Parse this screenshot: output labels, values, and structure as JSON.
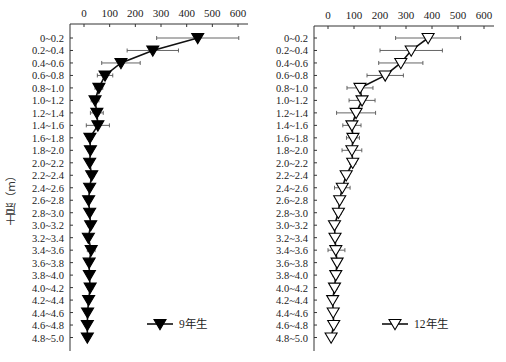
{
  "chart_data": [
    {
      "type": "line",
      "orientation": "horizontal-profile",
      "title": "",
      "xlabel": "",
      "ylabel": "土层（m）",
      "xlim": [
        0,
        600
      ],
      "xticks": [
        0,
        100,
        200,
        300,
        400,
        500,
        600
      ],
      "x_axis_position": "top",
      "grid": false,
      "legend_position": "lower right",
      "categories": [
        "0~0.2",
        "0.2~0.4",
        "0.4~0.6",
        "0.6~0.8",
        "0.8~1.0",
        "1.0~1.2",
        "1.2~1.4",
        "1.4~1.6",
        "1.6~1.8",
        "1.8~2.0",
        "2.0~2.2",
        "2.2~2.4",
        "2.4~2.6",
        "2.6~2.8",
        "2.8~3.0",
        "3.0~3.2",
        "3.2~3.4",
        "3.4~3.6",
        "3.6~3.8",
        "3.8~4.0",
        "4.0~4.2",
        "4.2~4.4",
        "4.4~4.6",
        "4.6~4.8",
        "4.8~5.0"
      ],
      "series": [
        {
          "name": "9年生",
          "marker": "filled-down-triangle",
          "values": [
            443,
            268,
            144,
            82,
            58,
            43,
            50,
            54,
            23,
            25,
            22,
            30,
            22,
            18,
            22,
            26,
            17,
            28,
            20,
            21,
            24,
            18,
            14,
            13,
            13
          ],
          "error": [
            160,
            100,
            75,
            30,
            15,
            15,
            25,
            45,
            10,
            8,
            8,
            10,
            6,
            6,
            8,
            10,
            6,
            15,
            6,
            6,
            10,
            6,
            6,
            6,
            4
          ]
        }
      ]
    },
    {
      "type": "line",
      "orientation": "horizontal-profile",
      "title": "",
      "xlabel": "",
      "ylabel": "",
      "xlim": [
        0,
        600
      ],
      "xticks": [
        0,
        100,
        200,
        300,
        400,
        500,
        600
      ],
      "x_axis_position": "top",
      "grid": false,
      "legend_position": "lower right",
      "categories": [
        "0~0.2",
        "0.2~0.4",
        "0.4~0.6",
        "0.6~0.8",
        "0.8~1.0",
        "1.0~1.2",
        "1.2~1.4",
        "1.4~1.6",
        "1.6~1.8",
        "1.8~2.0",
        "2.0~2.2",
        "2.2~2.4",
        "2.4~2.6",
        "2.6~2.8",
        "2.8~3.0",
        "3.0~3.2",
        "3.2~3.4",
        "3.4~3.6",
        "3.6~3.8",
        "3.8~4.0",
        "4.0~4.2",
        "4.2~4.4",
        "4.4~4.6",
        "4.6~4.8",
        "4.8~5.0"
      ],
      "series": [
        {
          "name": "12年生",
          "marker": "open-down-triangle",
          "values": [
            385,
            320,
            280,
            220,
            123,
            131,
            108,
            92,
            96,
            92,
            95,
            70,
            55,
            45,
            40,
            25,
            27,
            30,
            35,
            30,
            25,
            18,
            20,
            22,
            12
          ],
          "error": [
            125,
            120,
            85,
            70,
            50,
            50,
            75,
            35,
            25,
            38,
            12,
            10,
            30,
            10,
            10,
            8,
            8,
            35,
            10,
            10,
            10,
            8,
            8,
            8,
            6
          ]
        }
      ]
    }
  ],
  "left_panel": {
    "legend_label": "9年生",
    "ylabel": "土层（m）"
  },
  "right_panel": {
    "legend_label": "12年生"
  }
}
